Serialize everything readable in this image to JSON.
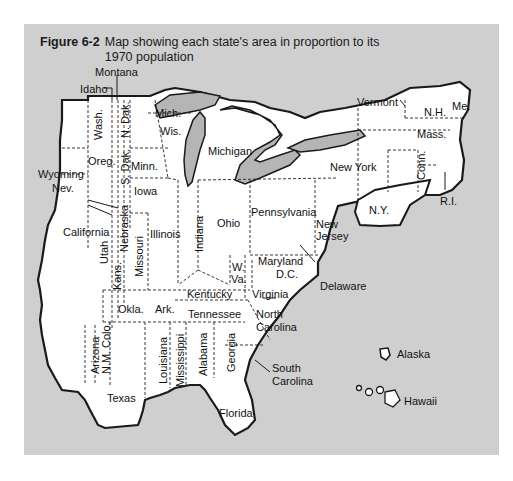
{
  "figure": {
    "number": "Figure 6-2",
    "caption": "Map showing each state's area in proportion to its 1970 population"
  },
  "colors": {
    "background": "#ffffff",
    "panel": "#cfcfcf",
    "land": "#ffffff",
    "water": "#b5b5b5",
    "outline": "#1a1a1a"
  },
  "states": {
    "montana": "Montana",
    "idaho": "Idaho",
    "washington": "Wash.",
    "oregon": "Oreg.",
    "wyoming": "Wyoming",
    "nevada": "Nev.",
    "california": "California",
    "utah": "Utah",
    "arizona": "Arizona",
    "new_mexico": "N.M.",
    "colorado": "Colo.",
    "north_dakota": "N. Dak.",
    "south_dakota": "S. Dak.",
    "nebraska": "Nebraska",
    "kansas": "Kans.",
    "oklahoma": "Okla.",
    "texas": "Texas",
    "minnesota": "Minn.",
    "iowa": "Iowa",
    "missouri": "Missouri",
    "arkansas": "Ark.",
    "louisiana": "Louisiana",
    "wisconsin": "Wis.",
    "michigan_up": "Mich.",
    "michigan": "Michigan",
    "illinois": "Illinois",
    "indiana": "Indiana",
    "ohio": "Ohio",
    "kentucky": "Kentucky",
    "tennessee": "Tennessee",
    "mississippi": "Mississippi",
    "alabama": "Alabama",
    "georgia": "Georgia",
    "florida": "Florida",
    "south_carolina": "South Carolina",
    "north_carolina": "North Carolina",
    "virginia": "Virginia",
    "west_virginia_1": "W.",
    "west_virginia_2": "Va.",
    "maryland": "Maryland",
    "dc": "D.C.",
    "delaware": "Delaware",
    "pennsylvania": "Pennsylvania",
    "new_jersey_1": "New",
    "new_jersey_2": "Jersey",
    "new_york": "New York",
    "ny_city": "N.Y.",
    "connecticut": "Conn.",
    "rhode_island": "R.I.",
    "massachusetts": "Mass.",
    "vermont": "Vermont",
    "new_hampshire": "N.H.",
    "maine": "Me.",
    "alaska": "Alaska",
    "hawaii": "Hawaii",
    "south_carolina_1": "South",
    "south_carolina_2": "Carolina",
    "north_carolina_1": "North",
    "north_carolina_2": "Carolina"
  }
}
